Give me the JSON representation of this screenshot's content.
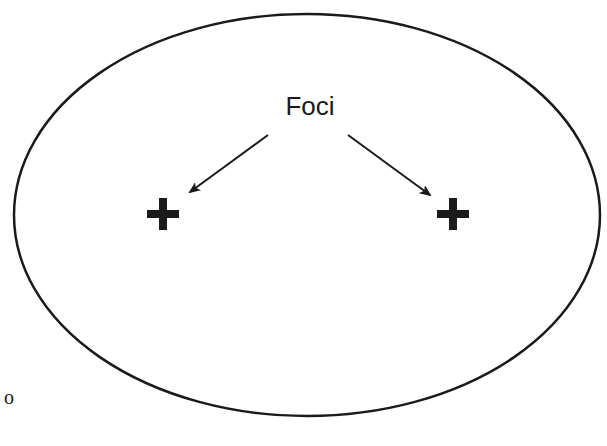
{
  "labels": {
    "foci": "Foci",
    "stray_mark": "o"
  },
  "ellipse": {
    "cx": 307,
    "cy": 215,
    "rx": 293,
    "ry": 201,
    "stroke": "#1a1a1a"
  },
  "foci_points": [
    {
      "name": "left-focus",
      "x": 163,
      "y": 214,
      "symbol": "+"
    },
    {
      "name": "right-focus",
      "x": 453,
      "y": 214,
      "symbol": "+"
    }
  ],
  "arrows": [
    {
      "from": [
        268,
        135
      ],
      "to": [
        190,
        192
      ]
    },
    {
      "from": [
        348,
        135
      ],
      "to": [
        430,
        195
      ]
    }
  ],
  "colors": {
    "ink": "#1a1a1a",
    "background": "#ffffff"
  }
}
